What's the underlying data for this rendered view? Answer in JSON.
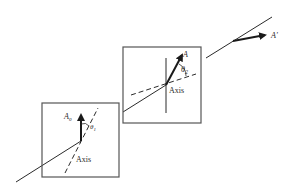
{
  "figure": {
    "colors": {
      "background": "#ffffff",
      "line": "#2a2a2a",
      "box": "#555555"
    }
  },
  "polarizer_1": {
    "label_amplitude": "A",
    "label_amplitude_sub": "0",
    "label_angle": "θ",
    "label_angle_sub": "1",
    "label_axis": "Axis"
  },
  "polarizer_2": {
    "label_amplitude": "A",
    "label_angle": "θ",
    "label_angle_sub": "2",
    "label_axis": "Axis"
  },
  "output": {
    "label_amplitude": "A'"
  }
}
